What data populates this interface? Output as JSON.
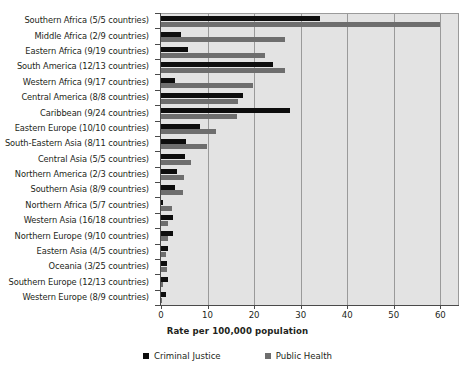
{
  "chart_data": {
    "type": "bar",
    "orientation": "horizontal",
    "title": "",
    "xlabel": "Rate per 100,000 population",
    "ylabel": "",
    "xlim": [
      0,
      64
    ],
    "xticks": [
      0,
      10,
      20,
      30,
      40,
      50,
      60
    ],
    "xticklabels": [
      "0",
      "10",
      "20",
      "30",
      "40",
      "50",
      "60"
    ],
    "grid": "vertical",
    "legend_position": "bottom",
    "categories": [
      "Southern Africa (5/5 countries)",
      "Middle Africa (2/9 countries)",
      "Eastern Africa (9/19 countries)",
      "South America (12/13 countries)",
      "Western Africa (9/17 countries)",
      "Central America (8/8 countries)",
      "Caribbean (9/24 countries)",
      "Eastern Europe (10/10 countries)",
      "South-Eastern Asia (8/11 countries)",
      "Central Asia (5/5 countries)",
      "Northern America (2/3 countries)",
      "Southern Asia (8/9 countries)",
      "Northern Africa (5/7 countries)",
      "Western Asia (16/18 countries)",
      "Northern Europe (9/10 countries)",
      "Eastern Asia (4/5 countries)",
      "Oceania (3/25 countries)",
      "Southern Europe (12/13 countries)",
      "Western Europe (8/9 countries)"
    ],
    "series": [
      {
        "name": "Criminal Justice",
        "color": "#0d0d0d",
        "values": [
          34.2,
          4.3,
          5.8,
          24.0,
          3.0,
          17.6,
          27.7,
          8.4,
          5.4,
          5.2,
          3.4,
          3.0,
          0.4,
          2.6,
          2.5,
          1.6,
          1.3,
          1.4,
          1.0
        ]
      },
      {
        "name": "Public Health",
        "color": "#6e6e6e",
        "values": [
          60.0,
          26.7,
          22.4,
          26.7,
          19.8,
          16.6,
          16.3,
          11.8,
          9.9,
          6.4,
          5.0,
          4.7,
          2.4,
          1.4,
          1.4,
          1.0,
          1.2,
          0.5,
          0.3
        ]
      }
    ]
  },
  "legend": {
    "items": [
      {
        "label": "Criminal Justice"
      },
      {
        "label": "Public Health"
      }
    ]
  }
}
